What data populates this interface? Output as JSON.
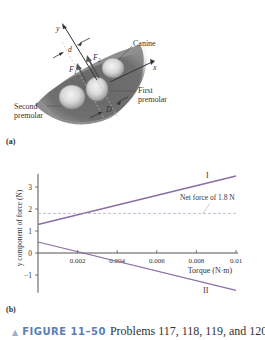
{
  "figure_a": {
    "panel_label": "(a)",
    "labels": {
      "y_axis": "y",
      "x_axis": "x",
      "d": "d",
      "D": "D",
      "F1": "F",
      "F1_sub": "1",
      "F2": "F",
      "F2_sub": "2",
      "canine": "Canine",
      "first_premolar_1": "First",
      "first_premolar_2": "premolar",
      "second_premolar_1": "Second",
      "second_premolar_2": "premolar"
    }
  },
  "figure_b": {
    "panel_label": "(b)"
  },
  "caption": {
    "marker": "▲",
    "figure_number": "FIGURE 11–50",
    "text": "Problems 117, 118, 119, and 120"
  },
  "colors": {
    "line_I": "#8a6fa3",
    "line_II": "#8a6fa3",
    "dashed": "#b9a6c9",
    "axis": "#555555",
    "gum": "#6e6e6e",
    "caption_blue": "#5a7fb5"
  },
  "chart_data": {
    "type": "line",
    "title": "",
    "xlabel": "Torque (N·m)",
    "ylabel": "y component of force (N)",
    "xlim": [
      0,
      0.01
    ],
    "ylim": [
      -1.8,
      3.6
    ],
    "x_ticks": [
      "0.002",
      "0.004",
      "0.006",
      "0.008",
      "0.01"
    ],
    "y_ticks": [
      "3",
      "2",
      "1",
      "0",
      "−1"
    ],
    "grid": false,
    "series": [
      {
        "name": "I",
        "x": [
          0,
          0.01
        ],
        "values": [
          1.3,
          3.5
        ]
      },
      {
        "name": "II",
        "x": [
          0,
          0.01
        ],
        "values": [
          0.5,
          -1.7
        ]
      },
      {
        "name": "Net force of 1.8 N",
        "x": [
          0,
          0.01
        ],
        "values": [
          1.8,
          1.8
        ],
        "style": "dashed"
      }
    ],
    "annotations": [
      {
        "text": "I",
        "near": "series I end"
      },
      {
        "text": "II",
        "near": "series II end"
      },
      {
        "text": "Net force of 1.8 N",
        "near": "dashed line"
      }
    ]
  }
}
